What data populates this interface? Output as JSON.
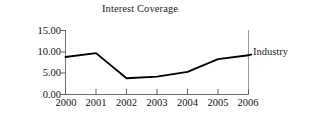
{
  "chart_data": {
    "type": "line",
    "title": "Interest Coverage",
    "xlabel": "",
    "ylabel": "",
    "categories": [
      "2000",
      "2001",
      "2002",
      "2003",
      "2004",
      "2005",
      "2006"
    ],
    "x": [
      2000,
      2001,
      2002,
      2003,
      2004,
      2005,
      2006
    ],
    "series": [
      {
        "name": "Industry",
        "values": [
          8.8,
          9.7,
          3.8,
          4.2,
          5.3,
          8.3,
          9.2
        ],
        "color": "#000000"
      }
    ],
    "ylim": [
      0,
      15
    ],
    "yticks": [
      0,
      5,
      10,
      15
    ],
    "ytick_labels": [
      "0.00",
      "5.00",
      "10.00",
      "15.00"
    ],
    "xlim": [
      2000,
      2006
    ],
    "grid": false,
    "legend_position": "right-inline",
    "annotations": [
      {
        "text": "Industry",
        "attached_to_series": "Industry",
        "at_x": 2006
      }
    ]
  },
  "axes": {
    "y_axis_name": "y-axis",
    "x_axis_name": "x-axis",
    "right_boundary_name": "right-boundary-line"
  }
}
